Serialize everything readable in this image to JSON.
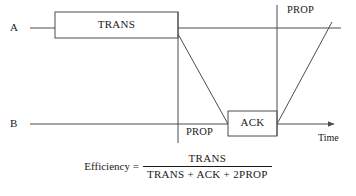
{
  "diagram": {
    "type": "timing-diagram",
    "stroke_color": "#4d4d4d",
    "text_color": "#1a1a1a",
    "background": "#ffffff",
    "timelines": [
      {
        "id": "A",
        "label": "A",
        "y": 28
      },
      {
        "id": "B",
        "label": "B",
        "y": 124
      }
    ],
    "boxes": [
      {
        "id": "trans",
        "label": "TRANS",
        "x": 55,
        "y": 12,
        "width": 123,
        "height": 26,
        "timeline": "A"
      },
      {
        "id": "ack",
        "label": "ACK",
        "x": 228,
        "y": 111,
        "width": 49,
        "height": 25,
        "timeline": "B"
      }
    ],
    "annotations": [
      {
        "id": "prop-top",
        "label": "PROP",
        "x": 287,
        "y": 6
      },
      {
        "id": "prop-bottom",
        "label": "PROP",
        "x": 186,
        "y": 128
      }
    ],
    "axis": {
      "label": "Time",
      "x": 318,
      "y": 135
    },
    "markers": [
      {
        "id": "divider-trans-end",
        "x": 178,
        "y1": 12,
        "y2": 143
      },
      {
        "id": "divider-ack-end",
        "x": 277,
        "y1": 5,
        "y2": 136
      }
    ],
    "propagation_edges": [
      {
        "id": "a-to-b",
        "x1": 178,
        "y1": 34,
        "x2": 228,
        "y2": 124
      },
      {
        "id": "b-to-a",
        "x1": 277,
        "y1": 124,
        "x2": 332,
        "y2": 22
      }
    ]
  },
  "formula": {
    "lead": "Efficiency =",
    "numerator": "TRANS",
    "denominator": "TRANS + ACK + 2PROP"
  }
}
